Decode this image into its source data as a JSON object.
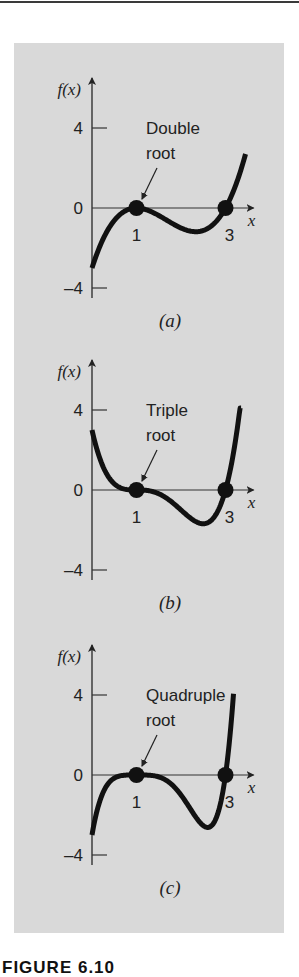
{
  "figure": {
    "caption": "FIGURE 6.10",
    "panel_color": "#d9d9d9",
    "curve_color": "#111111",
    "axis_color": "#333333"
  },
  "chart_data": [
    {
      "type": "line",
      "panel_label": "(a)",
      "annotation": [
        "Double",
        "root"
      ],
      "function": "(x-1)^2 (x-3)",
      "multiplicity": 2,
      "ylabel": "f(x)",
      "xlabel": "x",
      "y_ticks": [
        4,
        0,
        -4
      ],
      "x_tick_labels": [
        "1",
        "3"
      ],
      "roots": [
        1,
        3
      ],
      "x_range": [
        0,
        3.45
      ],
      "ylim": [
        -4,
        4
      ],
      "grid": false,
      "points": {
        "x": [
          0,
          0.5,
          1,
          1.5,
          2,
          2.33,
          2.5,
          3,
          3.2,
          3.45
        ],
        "y": [
          -3,
          -0.63,
          0,
          -0.38,
          -1,
          -1.19,
          -1.13,
          0,
          0.29,
          2.7
        ]
      }
    },
    {
      "type": "line",
      "panel_label": "(b)",
      "annotation": [
        "Triple",
        "root"
      ],
      "function": "(x-1)^3 (x-3)",
      "multiplicity": 3,
      "ylabel": "f(x)",
      "xlabel": "x",
      "y_ticks": [
        4,
        0,
        -4
      ],
      "x_tick_labels": [
        "1",
        "3"
      ],
      "roots": [
        1,
        3
      ],
      "x_range": [
        0,
        3.35
      ],
      "ylim": [
        -4,
        4
      ],
      "grid": false,
      "points": {
        "x": [
          0,
          0.5,
          1,
          1.5,
          2,
          2.5,
          3,
          3.2,
          3.35
        ],
        "y": [
          3,
          0.31,
          0,
          -0.19,
          -1,
          -1.69,
          0,
          2.13,
          4.54
        ]
      }
    },
    {
      "type": "line",
      "panel_label": "(c)",
      "annotation": [
        "Quadruple",
        "root"
      ],
      "function": "(x-1)^4 (x-3)",
      "multiplicity": 4,
      "ylabel": "f(x)",
      "xlabel": "x",
      "y_ticks": [
        4,
        0,
        -4
      ],
      "x_tick_labels": [
        "1",
        "3"
      ],
      "roots": [
        1,
        3
      ],
      "x_range": [
        0,
        3.18
      ],
      "ylim": [
        -4,
        4
      ],
      "grid": false,
      "points": {
        "x": [
          0,
          0.5,
          1,
          1.5,
          2,
          2.6,
          3,
          3.1,
          3.18
        ],
        "y": [
          -3,
          -0.16,
          0,
          -0.09,
          -1,
          -2.62,
          0,
          1.94,
          4.06
        ]
      }
    }
  ]
}
